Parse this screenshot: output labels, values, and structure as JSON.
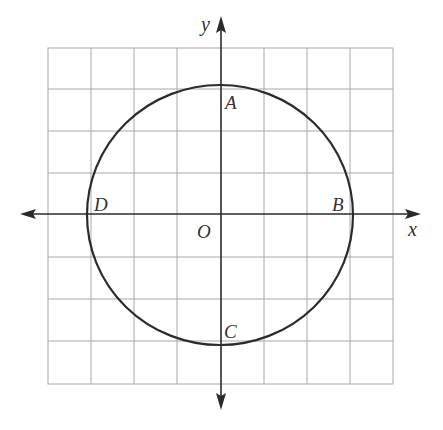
{
  "diagram": {
    "type": "coordinate-plane-circle",
    "grid": {
      "columns": 8,
      "rows": 8,
      "color": "#a8a8a8"
    },
    "axes": {
      "x_label": "x",
      "y_label": "y",
      "origin_label": "O",
      "color": "#2a2a2a"
    },
    "circle": {
      "center": "O",
      "color": "#2b2b2b"
    },
    "points": [
      {
        "name": "A",
        "label": "A",
        "position": "top (on y-axis)"
      },
      {
        "name": "B",
        "label": "B",
        "position": "right (on x-axis)"
      },
      {
        "name": "C",
        "label": "C",
        "position": "bottom (on y-axis)"
      },
      {
        "name": "D",
        "label": "D",
        "position": "left (on x-axis)"
      }
    ]
  }
}
